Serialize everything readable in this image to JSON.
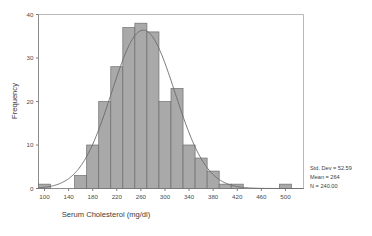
{
  "chart_data": {
    "type": "bar",
    "title": "",
    "subtitle": "",
    "xlabel": "Serum Cholesterol (mg/dl)",
    "ylabel": "Frequency",
    "xlim": [
      90,
      530
    ],
    "ylim": [
      0,
      40
    ],
    "grid": false,
    "legend_position": "right",
    "bin_width": 20,
    "xticks": [
      100,
      140,
      180,
      220,
      260,
      300,
      340,
      380,
      420,
      460,
      500
    ],
    "yticks": [
      0,
      10,
      20,
      30,
      40
    ],
    "xtick_labels": [
      "100",
      "140",
      "180",
      "220",
      "260",
      "300",
      "340",
      "380",
      "420",
      "460",
      "500"
    ],
    "ytick_labels": [
      "0",
      "10",
      "20",
      "30",
      "40"
    ],
    "categories": [
      100,
      120,
      140,
      160,
      180,
      200,
      220,
      240,
      260,
      280,
      300,
      320,
      340,
      360,
      380,
      400,
      420,
      440,
      460,
      480,
      500,
      520
    ],
    "values": [
      1,
      0,
      0,
      3,
      10,
      20,
      28,
      37,
      38,
      36,
      20,
      23,
      10,
      7,
      4,
      1,
      1,
      0,
      0,
      0,
      1,
      0
    ],
    "series": [
      {
        "name": "Frequency",
        "values": [
          1,
          0,
          0,
          3,
          10,
          20,
          28,
          37,
          38,
          36,
          20,
          23,
          10,
          7,
          4,
          1,
          1,
          0,
          0,
          0,
          1,
          0
        ]
      }
    ],
    "overlay": {
      "type": "normal-curve",
      "mean": 264,
      "std_dev": 52.59,
      "n": 240
    },
    "annotations": [
      "Std. Dev = 52.59",
      "Mean = 264",
      "N = 240.00"
    ]
  },
  "stats": {
    "std_dev_label": "Std. Dev = 52.59",
    "mean_label": "Mean = 264",
    "n_label": "N = 240.00"
  },
  "axes": {
    "x_title": "Serum Cholesterol (mg/dl)",
    "y_title": "Frequency"
  },
  "colors": {
    "bar_fill": "#a9a9a9",
    "bar_stroke": "#6e6e6e",
    "curve": "#6a6a6a",
    "axis": "#8c8c8c",
    "frame": "#b9b9b9",
    "text": "#3d3d3d",
    "background": "#ffffff"
  }
}
